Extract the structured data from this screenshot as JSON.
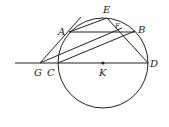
{
  "diagram": {
    "type": "geometry",
    "circle": {
      "center_label": "K",
      "cx": 103,
      "cy": 63,
      "r": 45
    },
    "points": {
      "A": {
        "x": 69,
        "y": 32,
        "label": "A"
      },
      "B": {
        "x": 135,
        "y": 32,
        "label": "B"
      },
      "E": {
        "x": 107,
        "y": 18,
        "label": "E"
      },
      "F": {
        "x": 118,
        "y": 30,
        "label": "F"
      },
      "C": {
        "x": 58,
        "y": 63,
        "label": "C"
      },
      "D": {
        "x": 148,
        "y": 63,
        "label": "D"
      },
      "G": {
        "x": 40,
        "y": 63,
        "label": "G"
      },
      "K": {
        "x": 103,
        "y": 63,
        "label": "K"
      }
    },
    "labels": [
      "A",
      "B",
      "C",
      "D",
      "E",
      "F",
      "G",
      "K"
    ],
    "segments": [
      "G-A (extended tangent)",
      "A-E",
      "A-B",
      "E-D",
      "G-B",
      "C-B",
      "line G-D through C and K"
    ],
    "stroke_color": "#222222"
  }
}
